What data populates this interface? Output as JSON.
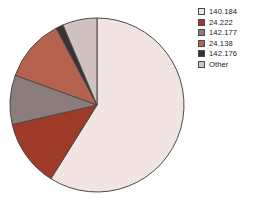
{
  "chart_data": {
    "type": "pie",
    "title": "",
    "legend_position": "right",
    "grid": false,
    "categories": [
      "140.184",
      "24.222",
      "142.177",
      "24.138",
      "142.176",
      "Other"
    ],
    "values": [
      58.9,
      12.5,
      9.2,
      11.7,
      1.4,
      6.3
    ],
    "unit": "percent",
    "start_angle_deg": 0,
    "direction": "clockwise",
    "slices": [
      {
        "label": "140.184",
        "value": 58.9,
        "sweep_deg": 212,
        "color": "#f2e4e2"
      },
      {
        "label": "24.222",
        "value": 12.5,
        "sweep_deg": 45,
        "color": "#9e3b28"
      },
      {
        "label": "142.177",
        "value": 9.2,
        "sweep_deg": 33,
        "color": "#8a7d7b"
      },
      {
        "label": "24.138",
        "value": 11.7,
        "sweep_deg": 42,
        "color": "#b5634e"
      },
      {
        "label": "142.176",
        "value": 1.4,
        "sweep_deg": 5,
        "color": "#3a3230"
      },
      {
        "label": "Other",
        "value": 6.3,
        "sweep_deg": 23,
        "color": "#cfc2c0"
      }
    ],
    "geometry": {
      "cx": 97,
      "cy": 105,
      "r": 87
    },
    "stroke_color": "#4a4a4a"
  },
  "legend": {
    "items": [
      {
        "label": "140.184",
        "color": "#f2e4e2"
      },
      {
        "label": "24.222",
        "color": "#9e3b28"
      },
      {
        "label": "142.177",
        "color": "#8a7d7b"
      },
      {
        "label": "24.138",
        "color": "#b5634e"
      },
      {
        "label": "142.176",
        "color": "#3a3230"
      },
      {
        "label": "Other",
        "color": "#cfc2c0"
      }
    ]
  }
}
